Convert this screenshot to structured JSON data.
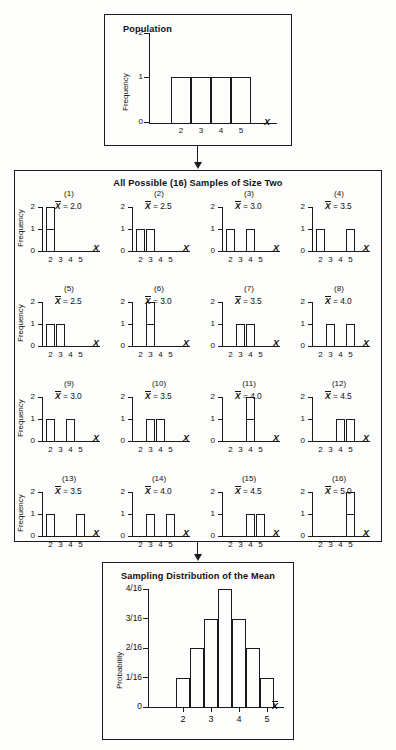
{
  "figure": {
    "background_color": "#fdfdfb",
    "line_color": "#1a1a1a"
  },
  "population": {
    "title": "Population",
    "y_axis_title": "Frequency",
    "x_axis_name": "X",
    "y_ticks": [
      "0",
      "1",
      "2"
    ],
    "x_ticks": [
      "2",
      "3",
      "4",
      "5"
    ]
  },
  "samples": {
    "title": "All Possible (16) Samples of Size Two",
    "y_axis_title": "Frequency",
    "x_axis_name": "X",
    "y_ticks": [
      "0",
      "1",
      "2"
    ],
    "x_ticks": [
      "2",
      "3",
      "4",
      "5"
    ],
    "items": [
      {
        "label": "(1)",
        "mean_text": "= 2.0",
        "values": [
          2,
          2
        ]
      },
      {
        "label": "(2)",
        "mean_text": "= 2.5",
        "values": [
          2,
          3
        ]
      },
      {
        "label": "(3)",
        "mean_text": "= 3.0",
        "values": [
          2,
          4
        ]
      },
      {
        "label": "(4)",
        "mean_text": "= 3.5",
        "values": [
          2,
          5
        ]
      },
      {
        "label": "(5)",
        "mean_text": "= 2.5",
        "values": [
          3,
          2
        ]
      },
      {
        "label": "(6)",
        "mean_text": "= 3.0",
        "values": [
          3,
          3
        ]
      },
      {
        "label": "(7)",
        "mean_text": "= 3.5",
        "values": [
          3,
          4
        ]
      },
      {
        "label": "(8)",
        "mean_text": "= 4.0",
        "values": [
          3,
          5
        ]
      },
      {
        "label": "(9)",
        "mean_text": "= 3.0",
        "values": [
          4,
          2
        ]
      },
      {
        "label": "(10)",
        "mean_text": "= 3.5",
        "values": [
          4,
          3
        ]
      },
      {
        "label": "(11)",
        "mean_text": "= 4.0",
        "values": [
          4,
          4
        ]
      },
      {
        "label": "(12)",
        "mean_text": "= 4.5",
        "values": [
          4,
          5
        ]
      },
      {
        "label": "(13)",
        "mean_text": "= 3.5",
        "values": [
          5,
          2
        ]
      },
      {
        "label": "(14)",
        "mean_text": "= 4.0",
        "values": [
          5,
          3
        ]
      },
      {
        "label": "(15)",
        "mean_text": "= 4.5",
        "values": [
          5,
          4
        ]
      },
      {
        "label": "(16)",
        "mean_text": "= 5.0",
        "values": [
          5,
          5
        ]
      }
    ]
  },
  "sampling_distribution": {
    "title": "Sampling Distribution of the Mean",
    "y_axis_title": "Probability",
    "x_axis_name": "X",
    "y_ticks": [
      "0",
      "1/16",
      "2/16",
      "3/16",
      "4/16"
    ],
    "x_ticks": [
      "2",
      "3",
      "4",
      "5"
    ]
  },
  "chart_data": [
    {
      "type": "bar",
      "title": "Population",
      "xlabel": "X",
      "ylabel": "Frequency",
      "categories": [
        2,
        3,
        4,
        5
      ],
      "values": [
        1,
        1,
        1,
        1
      ],
      "ylim": [
        0,
        2
      ],
      "yticks": [
        0,
        1,
        2
      ],
      "bars_contiguous": true,
      "grid": false,
      "legend": "none"
    },
    {
      "type": "bar",
      "title": "All Possible (16) Samples of Size Two",
      "xlabel": "X",
      "ylabel": "Frequency",
      "categories": [
        2,
        3,
        4,
        5
      ],
      "ylim": [
        0,
        2
      ],
      "yticks": [
        0,
        1,
        2
      ],
      "grid": false,
      "legend": "none",
      "series": [
        {
          "name": "(1)",
          "sample": [
            2,
            2
          ],
          "mean": 2.0,
          "values": [
            2,
            0,
            0,
            0
          ]
        },
        {
          "name": "(2)",
          "sample": [
            2,
            3
          ],
          "mean": 2.5,
          "values": [
            1,
            1,
            0,
            0
          ]
        },
        {
          "name": "(3)",
          "sample": [
            2,
            4
          ],
          "mean": 3.0,
          "values": [
            1,
            0,
            1,
            0
          ]
        },
        {
          "name": "(4)",
          "sample": [
            2,
            5
          ],
          "mean": 3.5,
          "values": [
            1,
            0,
            0,
            1
          ]
        },
        {
          "name": "(5)",
          "sample": [
            3,
            2
          ],
          "mean": 2.5,
          "values": [
            1,
            1,
            0,
            0
          ]
        },
        {
          "name": "(6)",
          "sample": [
            3,
            3
          ],
          "mean": 3.0,
          "values": [
            0,
            2,
            0,
            0
          ]
        },
        {
          "name": "(7)",
          "sample": [
            3,
            4
          ],
          "mean": 3.5,
          "values": [
            0,
            1,
            1,
            0
          ]
        },
        {
          "name": "(8)",
          "sample": [
            3,
            5
          ],
          "mean": 4.0,
          "values": [
            0,
            1,
            0,
            1
          ]
        },
        {
          "name": "(9)",
          "sample": [
            4,
            2
          ],
          "mean": 3.0,
          "values": [
            1,
            0,
            1,
            0
          ]
        },
        {
          "name": "(10)",
          "sample": [
            4,
            3
          ],
          "mean": 3.5,
          "values": [
            0,
            1,
            1,
            0
          ]
        },
        {
          "name": "(11)",
          "sample": [
            4,
            4
          ],
          "mean": 4.0,
          "values": [
            0,
            0,
            2,
            0
          ]
        },
        {
          "name": "(12)",
          "sample": [
            4,
            5
          ],
          "mean": 4.5,
          "values": [
            0,
            0,
            1,
            1
          ]
        },
        {
          "name": "(13)",
          "sample": [
            5,
            2
          ],
          "mean": 3.5,
          "values": [
            1,
            0,
            0,
            1
          ]
        },
        {
          "name": "(14)",
          "sample": [
            5,
            3
          ],
          "mean": 4.0,
          "values": [
            0,
            1,
            0,
            1
          ]
        },
        {
          "name": "(15)",
          "sample": [
            5,
            4
          ],
          "mean": 4.5,
          "values": [
            0,
            0,
            1,
            1
          ]
        },
        {
          "name": "(16)",
          "sample": [
            5,
            5
          ],
          "mean": 5.0,
          "values": [
            0,
            0,
            0,
            2
          ]
        }
      ]
    },
    {
      "type": "bar",
      "title": "Sampling Distribution of the Mean",
      "xlabel": "X",
      "ylabel": "Probability",
      "categories": [
        2.0,
        2.5,
        3.0,
        3.5,
        4.0,
        4.5,
        5.0
      ],
      "values": [
        0.0625,
        0.125,
        0.1875,
        0.25,
        0.1875,
        0.125,
        0.0625
      ],
      "value_labels": [
        "1/16",
        "2/16",
        "3/16",
        "4/16",
        "3/16",
        "2/16",
        "1/16"
      ],
      "ylim": [
        0,
        0.25
      ],
      "yticks": [
        0,
        0.0625,
        0.125,
        0.1875,
        0.25
      ],
      "ytick_labels": [
        "0",
        "1/16",
        "2/16",
        "3/16",
        "4/16"
      ],
      "xticks": [
        2,
        3,
        4,
        5
      ],
      "bars_contiguous": true,
      "grid": false,
      "legend": "none"
    }
  ]
}
